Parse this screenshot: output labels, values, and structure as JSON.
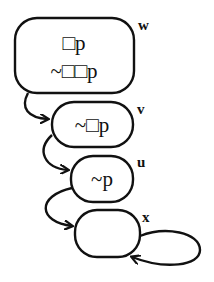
{
  "diagram": {
    "type": "kripke-frame",
    "worlds": [
      {
        "id": "w",
        "label": "w",
        "formulas": [
          "□p",
          "~□□p"
        ]
      },
      {
        "id": "v",
        "label": "v",
        "formulas": [
          "~□p"
        ]
      },
      {
        "id": "u",
        "label": "u",
        "formulas": [
          "~p"
        ]
      },
      {
        "id": "x",
        "label": "x",
        "formulas": []
      }
    ],
    "arrows": [
      {
        "from": "w",
        "to": "v"
      },
      {
        "from": "v",
        "to": "u"
      },
      {
        "from": "u",
        "to": "x"
      },
      {
        "from": "x",
        "to": "x"
      }
    ],
    "colors": {
      "stroke": "#111111",
      "background": "#ffffff"
    }
  }
}
